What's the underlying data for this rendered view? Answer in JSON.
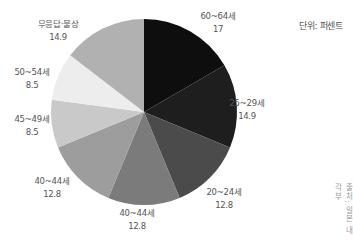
{
  "chart_data": {
    "type": "pie",
    "title": "",
    "unit_label": "단위: 퍼센트",
    "source": "출처: 일본 내각부",
    "start_angle_deg": 0,
    "direction": "clockwise",
    "slices": [
      {
        "label": "60~64세",
        "value": 17,
        "color": "#0e0e0e"
      },
      {
        "label": "25~29세",
        "value": 14.9,
        "color": "#1e1e1e"
      },
      {
        "label": "20~24세",
        "value": 12.8,
        "color": "#4b4b4b"
      },
      {
        "label": "40~44세",
        "value": 12.8,
        "color": "#7b7b7b"
      },
      {
        "label": "40~44세",
        "value": 12.8,
        "color": "#9d9d9d"
      },
      {
        "label": "45~49세",
        "value": 8.5,
        "color": "#c9c9c9"
      },
      {
        "label": "50~54세",
        "value": 8.5,
        "color": "#ededed"
      },
      {
        "label": "무응답·불상",
        "value": 14.9,
        "color": "#b1b1b1"
      }
    ],
    "categories": [
      "60~64세",
      "25~29세",
      "20~24세",
      "40~44세",
      "40~44세",
      "45~49세",
      "50~54세",
      "무응답·불상"
    ],
    "values": [
      17,
      14.9,
      12.8,
      12.8,
      12.8,
      8.5,
      8.5,
      14.9
    ],
    "value_labels": [
      "17",
      "14.9",
      "12.8",
      "12.8",
      "12.8",
      "8.5",
      "8.5",
      "14.9"
    ],
    "legend": "none",
    "grid": false
  },
  "labels": [
    {
      "name": "60~64세",
      "value": "17",
      "x": 218,
      "y": 10
    },
    {
      "name": "25~29세",
      "value": "14.9",
      "x": 247,
      "y": 97
    },
    {
      "name": "20~24세",
      "value": "12.8",
      "x": 224,
      "y": 186
    },
    {
      "name": "40~44세",
      "value": "12.8",
      "x": 137,
      "y": 207
    },
    {
      "name": "40~44세",
      "value": "12.8",
      "x": 52,
      "y": 175
    },
    {
      "name": "45~49세",
      "value": "8.5",
      "x": 32,
      "y": 113
    },
    {
      "name": "50~54세",
      "value": "8.5",
      "x": 32,
      "y": 66
    },
    {
      "name": "무응답·불상",
      "value": "14.9",
      "x": 58,
      "y": 18
    }
  ],
  "pie": {
    "cx": 144,
    "cy": 112,
    "r": 93
  }
}
